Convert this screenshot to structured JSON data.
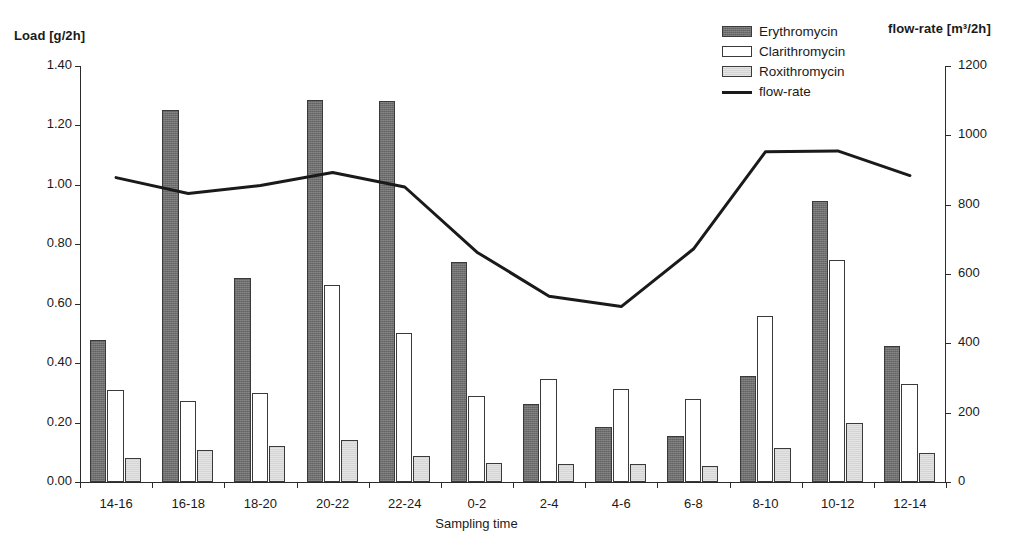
{
  "chart_data": {
    "type": "bar",
    "title": "",
    "xlabel": "Sampling time",
    "ylabel": "Load [g/2h]",
    "y2label": "flow-rate [m³/2h]",
    "ylim": [
      0,
      1.4
    ],
    "y2lim": [
      0,
      1200
    ],
    "grid": false,
    "legend_position": "top-right",
    "categories": [
      "14-16",
      "16-18",
      "18-20",
      "20-22",
      "22-24",
      "0-2",
      "2-4",
      "4-6",
      "6-8",
      "8-10",
      "10-12",
      "12-14"
    ],
    "y_ticks": [
      "0.00",
      "0.20",
      "0.40",
      "0.60",
      "0.80",
      "1.00",
      "1.20",
      "1.40"
    ],
    "y_tick_values": [
      0.0,
      0.2,
      0.4,
      0.6,
      0.8,
      1.0,
      1.2,
      1.4
    ],
    "y2_ticks": [
      "0",
      "200",
      "400",
      "600",
      "800",
      "1000",
      "1200"
    ],
    "y2_tick_values": [
      0,
      200,
      400,
      600,
      800,
      1000,
      1200
    ],
    "series": [
      {
        "name": "Erythromycin",
        "kind": "bar",
        "axis": "left",
        "color": "#6e6e6e",
        "values": [
          0.478,
          1.252,
          0.687,
          1.284,
          1.281,
          0.742,
          0.264,
          0.184,
          0.154,
          0.358,
          0.946,
          0.459
        ]
      },
      {
        "name": "Clarithromycin",
        "kind": "bar",
        "axis": "left",
        "color": "#ffffff",
        "values": [
          0.311,
          0.273,
          0.301,
          0.662,
          0.502,
          0.29,
          0.348,
          0.313,
          0.279,
          0.558,
          0.747,
          0.329
        ]
      },
      {
        "name": "Roxithromycin",
        "kind": "bar",
        "axis": "left",
        "color": "#d5d5d5",
        "values": [
          0.081,
          0.109,
          0.122,
          0.143,
          0.088,
          0.064,
          0.06,
          0.059,
          0.053,
          0.113,
          0.197,
          0.097
        ]
      },
      {
        "name": "flow-rate",
        "kind": "line",
        "axis": "right",
        "color": "#1a1a1a",
        "values": [
          878,
          832,
          855,
          893,
          851,
          663,
          536,
          506,
          672,
          953,
          955,
          884
        ]
      }
    ]
  },
  "legend": {
    "items": [
      {
        "label": "Erythromycin",
        "style": "erythromycin"
      },
      {
        "label": "Clarithromycin",
        "style": "clarithromycin"
      },
      {
        "label": "Roxithromycin",
        "style": "roxithromycin"
      },
      {
        "label": "flow-rate",
        "style": "line"
      }
    ]
  }
}
